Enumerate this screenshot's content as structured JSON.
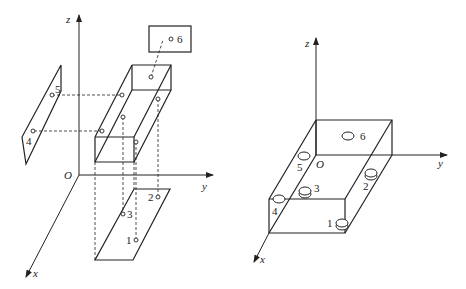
{
  "figure": {
    "left_diagram": {
      "title": "Projection of hole positions onto coordinate planes",
      "axes": {
        "origin": "O",
        "x": "x",
        "y": "y",
        "z": "z"
      },
      "points": [
        {
          "id": "1",
          "label": "1",
          "plane": "xy"
        },
        {
          "id": "2",
          "label": "2",
          "plane": "xy"
        },
        {
          "id": "3",
          "label": "3",
          "plane": "xy"
        },
        {
          "id": "4",
          "label": "4",
          "plane": "xz"
        },
        {
          "id": "5",
          "label": "5",
          "plane": "xz"
        },
        {
          "id": "6",
          "label": "6",
          "plane": "yz"
        }
      ]
    },
    "right_diagram": {
      "title": "Box with holes",
      "axes": {
        "origin": "O",
        "x": "x",
        "y": "y",
        "z": "z"
      },
      "holes": [
        {
          "id": "1",
          "label": "1"
        },
        {
          "id": "2",
          "label": "2"
        },
        {
          "id": "3",
          "label": "3"
        },
        {
          "id": "4",
          "label": "4"
        },
        {
          "id": "5",
          "label": "5"
        },
        {
          "id": "6",
          "label": "6"
        }
      ]
    },
    "colors": {
      "line": "#222222",
      "background": "#ffffff"
    }
  }
}
